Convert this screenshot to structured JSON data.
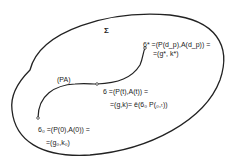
{
  "diagram": {
    "region_label": "Σ",
    "path_label": "(PA)",
    "points": [
      {
        "id": "end",
        "line1": "6* =(P(d_p),A(d_p)) =",
        "line2": "=(g*, k*)"
      },
      {
        "id": "middle",
        "line1": "6 =(P(t),A(t)) =",
        "line2": "=(g,k)= ê(6₀ P(₀,ₜ))"
      },
      {
        "id": "start",
        "line1": "6₀ =(P(0),A(0)) =",
        "line2": "=(g₀,k₀)"
      }
    ]
  }
}
